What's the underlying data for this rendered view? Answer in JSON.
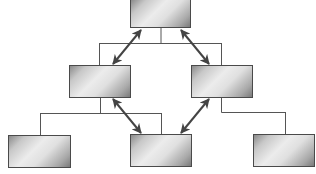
{
  "diagram": {
    "type": "hierarchy",
    "colors": {
      "box_border": "#4a4a4a",
      "box_gradient_dark": "#7a7a7a",
      "box_gradient_light": "#ececec",
      "connector": "#555555",
      "arrow": "#444444",
      "background": "#ffffff"
    },
    "nodes": [
      {
        "id": "top",
        "label": "",
        "x": 130,
        "y": 0,
        "w": 61,
        "h": 28
      },
      {
        "id": "mid-left",
        "label": "",
        "x": 69,
        "y": 65,
        "w": 62,
        "h": 33
      },
      {
        "id": "mid-right",
        "label": "",
        "x": 191,
        "y": 65,
        "w": 62,
        "h": 33
      },
      {
        "id": "bottom-left",
        "label": "",
        "x": 8,
        "y": 135,
        "w": 63,
        "h": 33
      },
      {
        "id": "bottom-center",
        "label": "",
        "x": 130,
        "y": 134,
        "w": 62,
        "h": 33
      },
      {
        "id": "bottom-right",
        "label": "",
        "x": 253,
        "y": 134,
        "w": 62,
        "h": 33
      }
    ],
    "connectors": [
      {
        "from": "top",
        "to": "mid-left",
        "style": "tree-line"
      },
      {
        "from": "top",
        "to": "mid-right",
        "style": "tree-line"
      },
      {
        "from": "mid-left",
        "to": "bottom-left",
        "style": "tree-line"
      },
      {
        "from": "mid-left",
        "to": "bottom-center",
        "style": "tree-line"
      },
      {
        "from": "mid-right",
        "to": "bottom-right",
        "style": "tree-line"
      }
    ],
    "arrows": [
      {
        "from": "top",
        "to": "mid-left",
        "style": "double-headed"
      },
      {
        "from": "top",
        "to": "mid-right",
        "style": "double-headed"
      },
      {
        "from": "mid-left",
        "to": "bottom-center",
        "style": "double-headed"
      },
      {
        "from": "mid-right",
        "to": "bottom-center",
        "style": "double-headed"
      }
    ]
  }
}
